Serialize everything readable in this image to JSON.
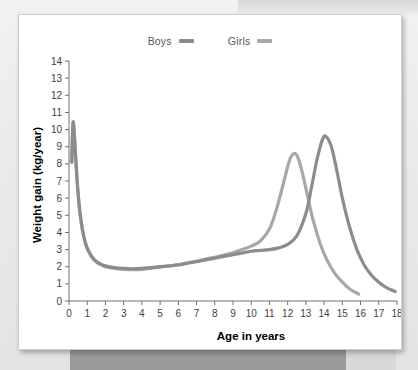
{
  "chart_data": {
    "type": "line",
    "title": "",
    "xlabel": "Age in years",
    "ylabel": "Weight gain (kg/year)",
    "xlim": [
      0,
      18
    ],
    "ylim": [
      0,
      14
    ],
    "xticks": [
      0,
      1,
      2,
      3,
      4,
      5,
      6,
      7,
      8,
      9,
      10,
      11,
      12,
      13,
      14,
      15,
      16,
      17,
      18
    ],
    "yticks": [
      0,
      1,
      2,
      3,
      4,
      5,
      6,
      7,
      8,
      9,
      10,
      11,
      12,
      13,
      14
    ],
    "grid": false,
    "legend_position": "top-center",
    "series": [
      {
        "name": "Boys",
        "color": "#8c8c8c",
        "x": [
          0.15,
          0.22,
          0.3,
          0.4,
          0.5,
          0.6,
          0.75,
          0.9,
          1.0,
          1.25,
          1.5,
          1.75,
          2.0,
          2.5,
          3.0,
          3.5,
          4.0,
          4.5,
          5.0,
          5.5,
          6.0,
          6.5,
          7.0,
          7.5,
          8.0,
          8.5,
          9.0,
          9.5,
          10.0,
          10.5,
          11.0,
          11.5,
          12.0,
          12.5,
          13.0,
          13.3,
          13.6,
          13.9,
          14.1,
          14.4,
          14.7,
          15.0,
          15.4,
          15.8,
          16.2,
          16.6,
          17.0,
          17.4,
          17.9
        ],
        "y": [
          8.1,
          10.4,
          9.6,
          7.8,
          6.3,
          5.2,
          4.1,
          3.4,
          3.1,
          2.6,
          2.3,
          2.15,
          2.05,
          1.95,
          1.9,
          1.88,
          1.9,
          1.95,
          2.0,
          2.05,
          2.1,
          2.2,
          2.3,
          2.4,
          2.5,
          2.6,
          2.7,
          2.8,
          2.9,
          2.95,
          3.0,
          3.1,
          3.3,
          3.8,
          5.1,
          6.6,
          8.2,
          9.4,
          9.6,
          9.0,
          7.6,
          6.0,
          4.3,
          3.0,
          2.1,
          1.5,
          1.1,
          0.8,
          0.55
        ]
      },
      {
        "name": "Girls",
        "color": "#a8a8a8",
        "x": [
          0.15,
          0.22,
          0.3,
          0.4,
          0.5,
          0.6,
          0.75,
          0.9,
          1.0,
          1.25,
          1.5,
          1.75,
          2.0,
          2.5,
          3.0,
          3.5,
          4.0,
          4.5,
          5.0,
          5.5,
          6.0,
          6.5,
          7.0,
          7.5,
          8.0,
          8.5,
          9.0,
          9.5,
          10.0,
          10.5,
          11.0,
          11.4,
          11.8,
          12.1,
          12.35,
          12.55,
          12.8,
          13.1,
          13.4,
          13.8,
          14.2,
          14.6,
          15.0,
          15.4,
          15.9
        ],
        "y": [
          8.1,
          10.35,
          9.5,
          7.7,
          6.2,
          5.1,
          4.05,
          3.35,
          3.05,
          2.55,
          2.28,
          2.12,
          2.0,
          1.9,
          1.85,
          1.83,
          1.85,
          1.92,
          1.98,
          2.05,
          2.12,
          2.22,
          2.32,
          2.45,
          2.55,
          2.68,
          2.82,
          3.0,
          3.2,
          3.5,
          4.2,
          5.4,
          7.0,
          8.2,
          8.6,
          8.4,
          7.5,
          6.1,
          4.7,
          3.3,
          2.3,
          1.6,
          1.1,
          0.7,
          0.4
        ]
      }
    ]
  },
  "legend": {
    "boys_label": "Boys",
    "girls_label": "Girls",
    "boys_color": "#8c8c8c",
    "girls_color": "#a8a8a8"
  },
  "axes": {
    "x_title": "Age in years",
    "y_title": "Weight gain (kg/year)"
  }
}
